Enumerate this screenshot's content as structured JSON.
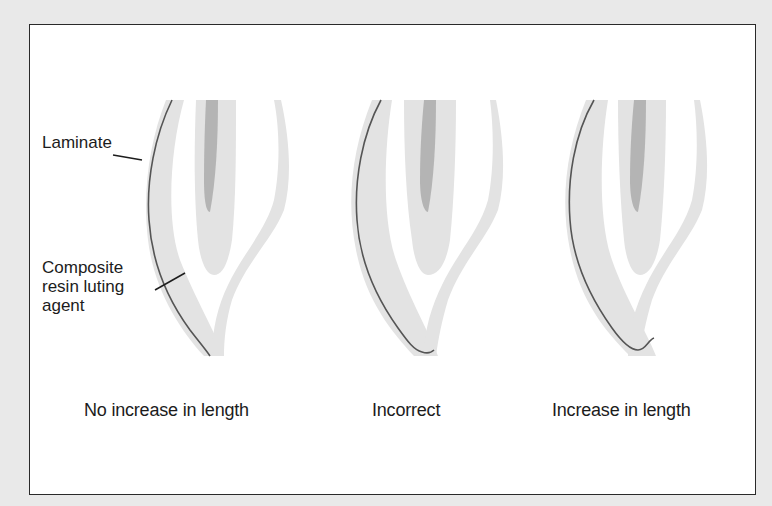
{
  "figure": {
    "labels": {
      "laminate": "Laminate",
      "composite_line1": "Composite",
      "composite_line2": "resin luting",
      "composite_line3": "agent"
    },
    "panels": [
      {
        "caption": "No increase in length"
      },
      {
        "caption": "Incorrect"
      },
      {
        "caption": "Increase in length"
      }
    ],
    "colors": {
      "background": "#e9e9e9",
      "frame_fill": "#ffffff",
      "frame_border": "#2a2a2a",
      "enamel_gray": "#e3e3e3",
      "pulp_gray": "#b4b4b4",
      "laminate_line": "#555555",
      "text": "#1c1c1c"
    }
  }
}
